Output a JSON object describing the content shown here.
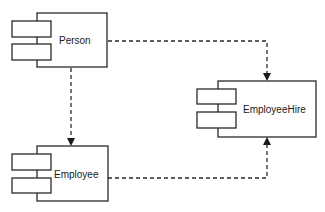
{
  "diagram": {
    "type": "UML component diagram",
    "components": [
      {
        "id": "person",
        "label": "Person"
      },
      {
        "id": "employee",
        "label": "Employee"
      },
      {
        "id": "employeehire",
        "label": "EmployeeHire"
      }
    ],
    "dependencies": [
      {
        "from": "Person",
        "to": "EmployeeHire",
        "style": "dashed-arrow"
      },
      {
        "from": "Person",
        "to": "Employee",
        "style": "dashed-arrow"
      },
      {
        "from": "Employee",
        "to": "EmployeeHire",
        "style": "dashed-arrow"
      }
    ],
    "colors": {
      "stroke": "#2a2a2a",
      "background": "#ffffff",
      "text": "#1a1a1a"
    }
  }
}
